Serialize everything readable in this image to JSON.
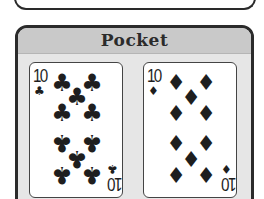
{
  "panel": {
    "title": "Pocket"
  },
  "cards": [
    {
      "rank": "10",
      "suit": "clubs",
      "suit_symbol": "♣",
      "color": "#1e1e1e"
    },
    {
      "rank": "10",
      "suit": "diamonds",
      "suit_symbol": "♦",
      "color": "#1e1e1e"
    }
  ],
  "colors": {
    "header_bg": "#c9c9c9",
    "panel_bg": "#e6e6e6",
    "border": "#2b2b2b"
  }
}
